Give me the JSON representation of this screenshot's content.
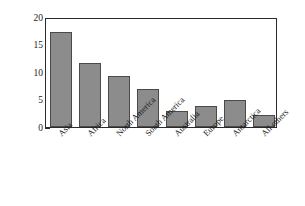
{
  "chart_data": {
    "type": "bar",
    "title": "",
    "xlabel": "",
    "ylabel": "Area (millions of sq. miles)",
    "categories": [
      "Asia",
      "Africa",
      "North America",
      "South America",
      "Australia",
      "Europe",
      "Antarctica",
      "All others"
    ],
    "values": [
      17.3,
      11.6,
      9.3,
      6.9,
      3.0,
      3.8,
      5.0,
      2.1
    ],
    "ylim": [
      0,
      20
    ],
    "yticks": [
      "0",
      "5",
      "10",
      "15",
      "20"
    ],
    "ytick_values": [
      0,
      5,
      10,
      15,
      20
    ],
    "grid": false,
    "legend": false,
    "bar_color": "#8c8c8c",
    "bar_edge_color": "#4a4a4a",
    "axis_color": "#2b2b2b"
  }
}
